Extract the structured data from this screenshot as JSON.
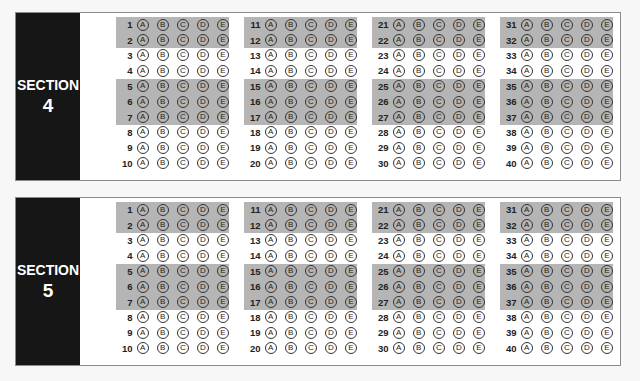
{
  "sections": [
    {
      "label": "SECTION",
      "number": "4",
      "top": 12
    },
    {
      "label": "SECTION",
      "number": "5",
      "top": 197
    }
  ],
  "choices": [
    "A",
    "B",
    "C",
    "D",
    "E"
  ],
  "columns": [
    {
      "questions": [
        1,
        2,
        3,
        4,
        5,
        6,
        7,
        8,
        9,
        10
      ]
    },
    {
      "questions": [
        11,
        12,
        13,
        14,
        15,
        16,
        17,
        18,
        19,
        20
      ]
    },
    {
      "questions": [
        21,
        22,
        23,
        24,
        25,
        26,
        27,
        28,
        29,
        30
      ]
    },
    {
      "questions": [
        31,
        32,
        33,
        34,
        35,
        36,
        37,
        38,
        39,
        40
      ]
    }
  ],
  "shaded_row_groups": [
    [
      0,
      1
    ],
    [
      4,
      5,
      6
    ]
  ],
  "colors": {
    "strip": "#161616",
    "band": "#b5b5b5",
    "panel_border": "#8a8a8a"
  }
}
